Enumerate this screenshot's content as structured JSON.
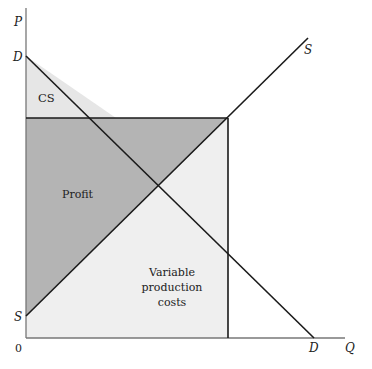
{
  "diagram": {
    "type": "supply-demand-surplus",
    "axes": {
      "y_label": "P",
      "x_label": "Q",
      "origin_label": "0"
    },
    "curves": {
      "demand": {
        "start_label": "D",
        "end_label": "D"
      },
      "supply": {
        "start_label": "S",
        "end_label": "S"
      }
    },
    "regions": {
      "consumer_surplus": {
        "label": "CS",
        "color": "#e6e6e6"
      },
      "profit": {
        "label": "Profit",
        "color": "#b4b4b4"
      },
      "variable_costs": {
        "label_lines": [
          "Variable",
          "production",
          "costs"
        ],
        "color": "#efefef"
      }
    },
    "line_color": "#1a1a1a",
    "axis_color": "#777777"
  }
}
